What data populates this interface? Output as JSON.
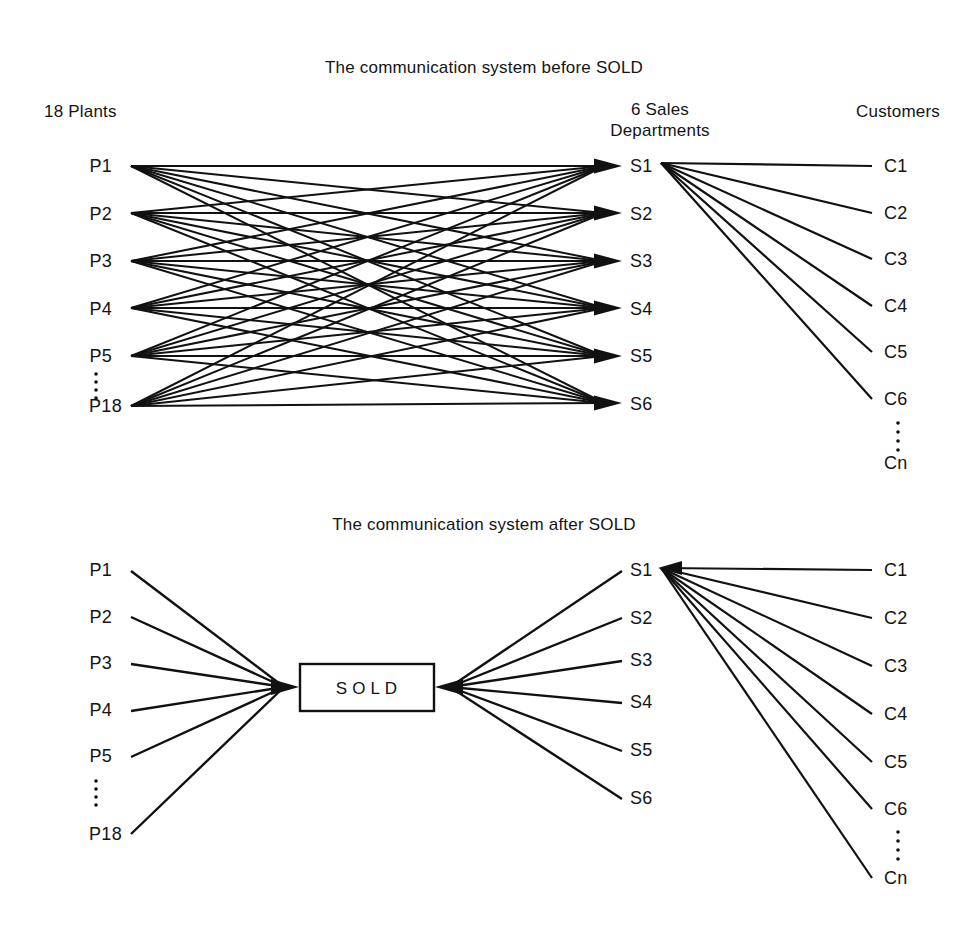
{
  "page": {
    "background": "#ffffff",
    "ink": "#111111",
    "width": 968,
    "height": 929
  },
  "diagrams": [
    {
      "id": "before",
      "title": "The communication system before SOLD",
      "headers": {
        "left": "18 Plants",
        "middle_line1": "6 Sales",
        "middle_line2": "Departments",
        "right": "Customers"
      },
      "columns": {
        "plants": [
          "P1",
          "P2",
          "P3",
          "P4",
          "P5",
          "P18"
        ],
        "sales": [
          "S1",
          "S2",
          "S3",
          "S4",
          "S5",
          "S6"
        ],
        "customers": [
          "C1",
          "C2",
          "C3",
          "C4",
          "C5",
          "C6",
          "Cn"
        ]
      },
      "ellipsis": {
        "plants_between": [
          "P5",
          "P18"
        ],
        "customers_between": [
          "C6",
          "Cn"
        ]
      },
      "topology": {
        "plants_to_sales": "full-mesh",
        "plants_to_sales_edge_count": 36,
        "sales_to_customers_source": "S1",
        "sales_to_customers_targets": [
          "C1",
          "C2",
          "C3",
          "C4",
          "C5",
          "C6"
        ],
        "arrowheads_at": "sales"
      }
    },
    {
      "id": "after",
      "title": "The communication system after SOLD",
      "headers": {
        "left": "",
        "middle_line1": "",
        "middle_line2": "",
        "right": ""
      },
      "hub_label": "SOLD",
      "columns": {
        "plants": [
          "P1",
          "P2",
          "P3",
          "P4",
          "P5",
          "P18"
        ],
        "sales": [
          "S1",
          "S2",
          "S3",
          "S4",
          "S5",
          "S6"
        ],
        "customers": [
          "C1",
          "C2",
          "C3",
          "C4",
          "C5",
          "C6",
          "Cn"
        ]
      },
      "ellipsis": {
        "plants_between": [
          "P5",
          "P18"
        ],
        "customers_between": [
          "C6",
          "Cn"
        ]
      },
      "topology": {
        "plants_to_hub": "converge",
        "plants_to_hub_edge_count": 6,
        "hub_to_sales": "fan-out",
        "hub_to_sales_edge_count": 6,
        "sales_to_customers_source": "S1",
        "sales_to_customers_targets": [
          "C1",
          "C2",
          "C3",
          "C4",
          "C5",
          "C6",
          "Cn"
        ],
        "arrowheads_at": "hub"
      }
    }
  ],
  "chart_data": {
    "type": "diagram",
    "panels": [
      {
        "name": "before",
        "title": "The communication system before SOLD",
        "node_groups": [
          {
            "name": "18 Plants",
            "nodes": [
              "P1",
              "P2",
              "P3",
              "P4",
              "P5",
              "P18"
            ],
            "truncated": true,
            "total": 18
          },
          {
            "name": "6 Sales Departments",
            "nodes": [
              "S1",
              "S2",
              "S3",
              "S4",
              "S5",
              "S6"
            ],
            "truncated": false,
            "total": 6
          },
          {
            "name": "Customers",
            "nodes": [
              "C1",
              "C2",
              "C3",
              "C4",
              "C5",
              "C6",
              "Cn"
            ],
            "truncated": true,
            "total": "n"
          }
        ],
        "edges_description": "Every plant connects directly to every sales department (full mesh, 36 shown lines); S1 connects to C1..C6."
      },
      {
        "name": "after",
        "title": "The communication system after SOLD",
        "node_groups": [
          {
            "name": "Plants",
            "nodes": [
              "P1",
              "P2",
              "P3",
              "P4",
              "P5",
              "P18"
            ],
            "truncated": true,
            "total": 18
          },
          {
            "name": "SOLD",
            "nodes": [
              "SOLD"
            ],
            "truncated": false,
            "total": 1
          },
          {
            "name": "Sales",
            "nodes": [
              "S1",
              "S2",
              "S3",
              "S4",
              "S5",
              "S6"
            ],
            "truncated": false,
            "total": 6
          },
          {
            "name": "Customers",
            "nodes": [
              "C1",
              "C2",
              "C3",
              "C4",
              "C5",
              "C6",
              "Cn"
            ],
            "truncated": true,
            "total": "n"
          }
        ],
        "edges_description": "All plants converge on a single SOLD hub, which fans out to S1..S6; S1 connects to C1..C6 and Cn."
      }
    ]
  }
}
